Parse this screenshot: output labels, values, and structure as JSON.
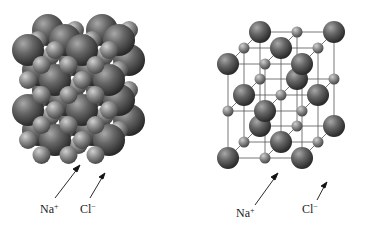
{
  "figure": {
    "left_model": {
      "type": "space-filling",
      "labels": {
        "na": {
          "symbol": "Na",
          "charge": "+"
        },
        "cl": {
          "symbol": "Cl",
          "charge": "−"
        }
      }
    },
    "right_model": {
      "type": "ball-and-stick",
      "labels": {
        "na": {
          "symbol": "Na",
          "charge": "+"
        },
        "cl": {
          "symbol": "Cl",
          "charge": "−"
        }
      }
    },
    "colors": {
      "sphere_dark": "#3a3a3a",
      "sphere_light": "#9a9a9a",
      "line": "#444444",
      "background": "#ffffff"
    }
  }
}
